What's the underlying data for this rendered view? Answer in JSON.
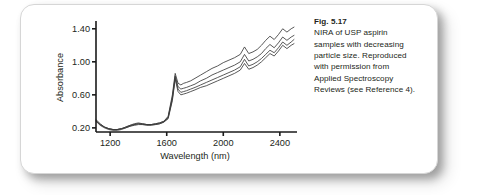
{
  "figure": {
    "caption": {
      "fig_number": "Fig. 5.17",
      "lines": [
        "NIRA of USP aspirin",
        "samples with decreasing",
        "particle size. Reproduced",
        "with permission from",
        "Applied Spectroscopy",
        "Reviews (see Reference 4)."
      ],
      "full_text": "Fig. 5.17 NIRA of USP aspirin samples with decreasing particle size. Reproduced with permission from Applied Spectroscopy Reviews (see Reference 4)."
    },
    "colors": {
      "card_background": "#ffffff",
      "card_border": "#d6d6d6",
      "text": "#231f20",
      "axis": "#1a1a1a",
      "trace": "#3b3b3b"
    }
  },
  "chart_data": {
    "type": "line",
    "title": "",
    "subtitle": "",
    "xlabel": "Wavelength (nm)",
    "ylabel": "Absorbance",
    "xlim": [
      1100,
      2500
    ],
    "ylim": [
      0.15,
      1.47
    ],
    "xticks": [
      1200,
      1600,
      2000,
      2400
    ],
    "xtick_labels": [
      "1200",
      "1600",
      "2000",
      "2400"
    ],
    "yticks": [
      0.2,
      0.6,
      1.0,
      1.4
    ],
    "ytick_labels": [
      "0.20",
      "0.60",
      "1.00",
      "1.40"
    ],
    "grid": false,
    "legend": false,
    "legend_position": "none",
    "annotations": [],
    "x": [
      1100,
      1130,
      1160,
      1190,
      1220,
      1250,
      1280,
      1310,
      1340,
      1370,
      1400,
      1430,
      1460,
      1490,
      1520,
      1550,
      1580,
      1610,
      1640,
      1660,
      1680,
      1700,
      1720,
      1740,
      1770,
      1800,
      1840,
      1880,
      1920,
      1960,
      2000,
      2040,
      2080,
      2120,
      2150,
      2180,
      2210,
      2240,
      2270,
      2300,
      2330,
      2360,
      2390,
      2420,
      2450,
      2480,
      2500
    ],
    "series": [
      {
        "name": "smallest particle size",
        "values": [
          0.3,
          0.25,
          0.21,
          0.19,
          0.18,
          0.18,
          0.19,
          0.21,
          0.23,
          0.25,
          0.26,
          0.25,
          0.24,
          0.24,
          0.25,
          0.26,
          0.28,
          0.34,
          0.6,
          0.86,
          0.74,
          0.72,
          0.74,
          0.75,
          0.77,
          0.8,
          0.84,
          0.88,
          0.92,
          0.95,
          0.99,
          1.02,
          1.05,
          1.09,
          1.18,
          1.1,
          1.12,
          1.15,
          1.2,
          1.26,
          1.31,
          1.27,
          1.33,
          1.4,
          1.36,
          1.4,
          1.42
        ]
      },
      {
        "name": "small particle size",
        "values": [
          0.29,
          0.24,
          0.21,
          0.19,
          0.18,
          0.18,
          0.19,
          0.21,
          0.23,
          0.24,
          0.25,
          0.25,
          0.24,
          0.24,
          0.25,
          0.26,
          0.28,
          0.33,
          0.57,
          0.83,
          0.7,
          0.67,
          0.68,
          0.69,
          0.71,
          0.73,
          0.77,
          0.8,
          0.84,
          0.87,
          0.9,
          0.93,
          0.96,
          1.0,
          1.09,
          1.01,
          1.03,
          1.06,
          1.1,
          1.16,
          1.21,
          1.17,
          1.23,
          1.3,
          1.26,
          1.3,
          1.32
        ]
      },
      {
        "name": "medium particle size",
        "values": [
          0.28,
          0.24,
          0.21,
          0.19,
          0.18,
          0.18,
          0.19,
          0.2,
          0.22,
          0.24,
          0.25,
          0.24,
          0.24,
          0.24,
          0.24,
          0.25,
          0.27,
          0.32,
          0.55,
          0.81,
          0.67,
          0.63,
          0.64,
          0.65,
          0.67,
          0.69,
          0.72,
          0.75,
          0.78,
          0.81,
          0.84,
          0.87,
          0.9,
          0.94,
          1.03,
          0.95,
          0.97,
          1.0,
          1.04,
          1.09,
          1.14,
          1.11,
          1.17,
          1.24,
          1.2,
          1.24,
          1.27
        ]
      },
      {
        "name": "largest particle size",
        "values": [
          0.28,
          0.23,
          0.2,
          0.18,
          0.17,
          0.17,
          0.18,
          0.2,
          0.22,
          0.23,
          0.24,
          0.24,
          0.23,
          0.23,
          0.24,
          0.25,
          0.27,
          0.31,
          0.53,
          0.79,
          0.64,
          0.6,
          0.61,
          0.62,
          0.64,
          0.66,
          0.69,
          0.71,
          0.74,
          0.77,
          0.8,
          0.83,
          0.86,
          0.9,
          0.98,
          0.91,
          0.93,
          0.96,
          1.0,
          1.05,
          1.1,
          1.07,
          1.13,
          1.2,
          1.16,
          1.2,
          1.22
        ]
      }
    ]
  }
}
